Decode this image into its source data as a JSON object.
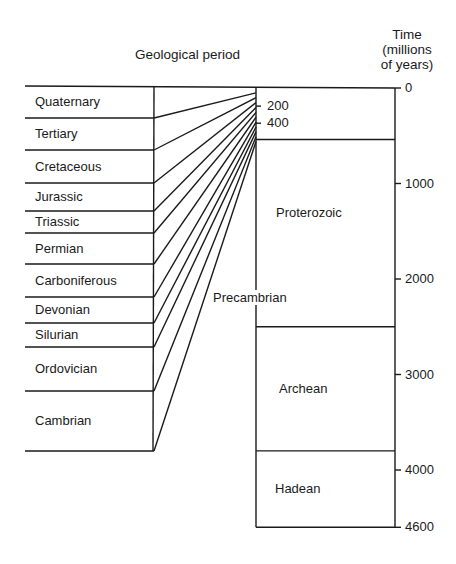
{
  "header": {
    "left_title": "Geological period",
    "right_title_line1": "Time",
    "right_title_line2": "(millions",
    "right_title_line3": "of years)"
  },
  "periods": [
    {
      "name": "Quaternary",
      "top": 86,
      "bottom": 118
    },
    {
      "name": "Tertiary",
      "top": 118,
      "bottom": 150
    },
    {
      "name": "Cretaceous",
      "top": 150,
      "bottom": 183
    },
    {
      "name": "Jurassic",
      "top": 183,
      "bottom": 211
    },
    {
      "name": "Triassic",
      "top": 211,
      "bottom": 233
    },
    {
      "name": "Permian",
      "top": 233,
      "bottom": 264
    },
    {
      "name": "Carboniferous",
      "top": 264,
      "bottom": 297
    },
    {
      "name": "Devonian",
      "top": 297,
      "bottom": 323
    },
    {
      "name": "Silurian",
      "top": 323,
      "bottom": 347
    },
    {
      "name": "Ordovician",
      "top": 347,
      "bottom": 391
    },
    {
      "name": "Cambrian",
      "top": 391,
      "bottom": 451
    }
  ],
  "eons": [
    {
      "name": "Proterozoic",
      "start_ma": 540,
      "end_ma": 2500
    },
    {
      "name": "Archean",
      "start_ma": 2500,
      "end_ma": 3800
    },
    {
      "name": "Hadean",
      "start_ma": 3800,
      "end_ma": 4600
    }
  ],
  "precambrian_label": "Precambrian",
  "phanerozoic_ticks": [
    {
      "value": 200,
      "label": "200"
    },
    {
      "value": 400,
      "label": "400"
    }
  ],
  "axis_ticks": [
    {
      "value": 0,
      "label": "0"
    },
    {
      "value": 1000,
      "label": "1000"
    },
    {
      "value": 2000,
      "label": "2000"
    },
    {
      "value": 3000,
      "label": "3000"
    },
    {
      "value": 4000,
      "label": "4000"
    },
    {
      "value": 4600,
      "label": "4600"
    }
  ],
  "colors": {
    "ink": "#1a1a1a",
    "background": "#ffffff"
  }
}
